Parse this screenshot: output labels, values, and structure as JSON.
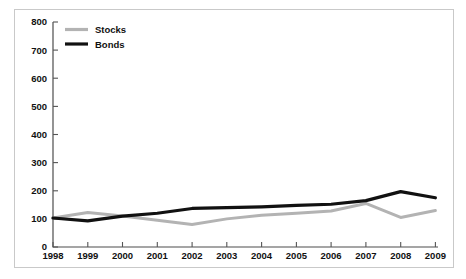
{
  "chart_data": {
    "type": "line",
    "title": "",
    "subtitle": "",
    "xlabel": "",
    "ylabel": "",
    "categories": [
      "1998",
      "1999",
      "2000",
      "2001",
      "2002",
      "2003",
      "2004",
      "2005",
      "2006",
      "2007",
      "2008",
      "2009"
    ],
    "x": [
      1998,
      1999,
      2000,
      2001,
      2002,
      2003,
      2004,
      2005,
      2006,
      2007,
      2008,
      2009
    ],
    "series": [
      {
        "name": "Stocks",
        "color": "#b3b3b3",
        "values": [
          103,
          123,
          110,
          95,
          80,
          100,
          113,
          120,
          128,
          155,
          105,
          130
        ]
      },
      {
        "name": "Bonds",
        "color": "#111111",
        "values": [
          103,
          93,
          110,
          120,
          137,
          140,
          143,
          148,
          152,
          165,
          197,
          175
        ]
      }
    ],
    "ylim": [
      0,
      800
    ],
    "yticks": [
      0,
      100,
      200,
      300,
      400,
      500,
      600,
      700,
      800
    ],
    "ytick_labels": [
      "0",
      "100",
      "200",
      "300",
      "400",
      "500",
      "600",
      "700",
      "800"
    ],
    "xlim": [
      1998,
      2009
    ],
    "grid": false,
    "legend_position": "top-left",
    "legend_entries": [
      {
        "label": "Stocks",
        "color": "#b3b3b3"
      },
      {
        "label": "Bonds",
        "color": "#111111"
      }
    ]
  },
  "colors": {
    "stocks": "#b3b3b3",
    "bonds": "#111111",
    "axis": "#4d4d4d",
    "frame": "#c9c9c9",
    "background": "#ffffff",
    "text": "#111111"
  }
}
